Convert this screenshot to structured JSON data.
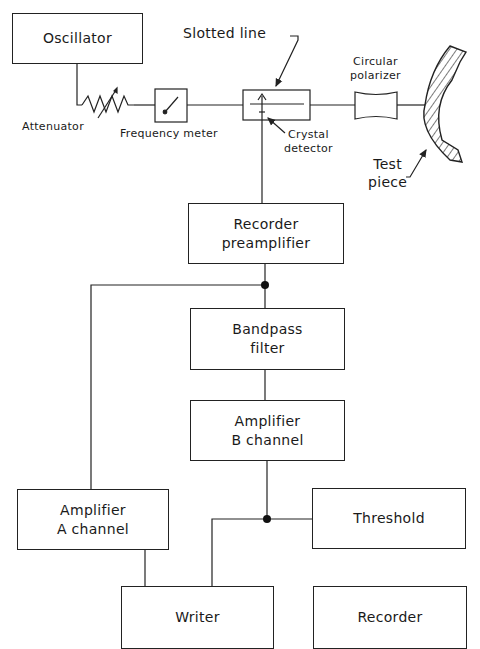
{
  "diagram": {
    "type": "block-diagram",
    "nodes": {
      "oscillator": "Oscillator",
      "recorder_preamplifier": [
        "Recorder",
        "preamplifier"
      ],
      "bandpass_filter": [
        "Bandpass",
        "filter"
      ],
      "amplifier_b": [
        "Amplifier",
        "B channel"
      ],
      "amplifier_a": [
        "Amplifier",
        "A channel"
      ],
      "threshold": "Threshold",
      "writer": "Writer",
      "recorder": "Recorder"
    },
    "labels": {
      "attenuator": "Attenuator",
      "frequency_meter": "Frequency meter",
      "slotted_line": "Slotted line",
      "crystal_detector": [
        "Crystal",
        "detector"
      ],
      "circular_polarizer": [
        "Circular",
        "polarizer"
      ],
      "test_piece": [
        "Test",
        "piece"
      ]
    },
    "edges": [
      [
        "Oscillator",
        "Attenuator"
      ],
      [
        "Attenuator",
        "Frequency meter"
      ],
      [
        "Frequency meter",
        "Slotted line"
      ],
      [
        "Slotted line",
        "Circular polarizer"
      ],
      [
        "Circular polarizer",
        "Test piece"
      ],
      [
        "Crystal detector",
        "Recorder preamplifier"
      ],
      [
        "Recorder preamplifier",
        "Bandpass filter"
      ],
      [
        "Recorder preamplifier",
        "Amplifier A channel"
      ],
      [
        "Bandpass filter",
        "Amplifier B channel"
      ],
      [
        "Amplifier B channel",
        "Threshold"
      ],
      [
        "Amplifier B channel",
        "Writer"
      ],
      [
        "Amplifier A channel",
        "Writer"
      ]
    ]
  }
}
